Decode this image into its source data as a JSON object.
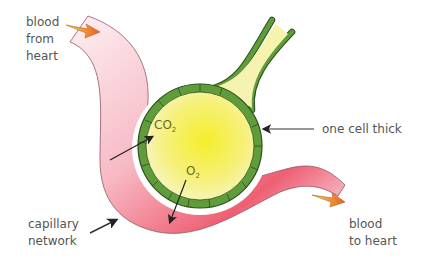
{
  "diagram": {
    "labels": {
      "blood_from_heart": "blood\nfrom\nheart",
      "one_cell_thick": "one cell thick",
      "capillary_network": "capillary\nnetwork",
      "blood_to_heart": "blood\nto heart"
    },
    "gases": {
      "co2_base": "CO",
      "co2_sub": "2",
      "o2_base": "O",
      "o2_sub": "2"
    },
    "colors": {
      "capillary_light": "#fbe3ea",
      "capillary_dark": "#ee5f73",
      "alveolus_center": "#f7f03a",
      "alveolus_edge": "#f6f3b0",
      "wall_green": "#5f9c3a",
      "wall_outline": "#2e4e1c",
      "flow_arrow": "#f07a2a",
      "text": "#555555"
    }
  }
}
